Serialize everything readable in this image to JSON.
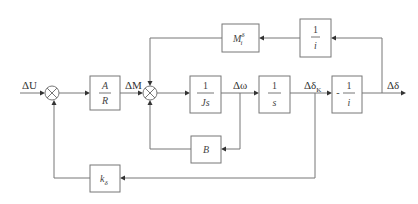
{
  "diagram": {
    "type": "control block diagram",
    "signals": {
      "input": "ΔU",
      "torque": "ΔM",
      "speed": "Δω",
      "angle_k": "Δδ",
      "angle_k_sub": "K",
      "output": "Δδ"
    },
    "blocks": {
      "gain_ar": {
        "num": "A",
        "den": "R"
      },
      "inertia": {
        "num": "1",
        "den": "Js"
      },
      "integrator": {
        "num": "1",
        "den": "s"
      },
      "neg_ratio": {
        "sign": "-",
        "num": "1",
        "den": "i"
      },
      "ratio_fb": {
        "num": "1",
        "den": "i"
      },
      "torque_fb": {
        "base": "M",
        "sup": "δ",
        "sub": "i"
      },
      "damping": {
        "label": "B"
      },
      "angle_fb": {
        "base": "k",
        "sub": "δ"
      }
    },
    "summing_junctions": [
      "sum-1",
      "sum-2"
    ]
  }
}
